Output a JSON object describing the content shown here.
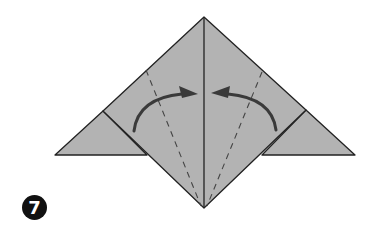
{
  "diagram": {
    "type": "origami-step",
    "step_number": "7",
    "colors": {
      "paper": "#b3b3b3",
      "outline": "#222222",
      "arrow": "#3a3a3a",
      "valley_fold": "#444444",
      "badge": "#111111"
    },
    "elements": [
      {
        "name": "paper-shape",
        "description": "diamond with left and right triangular flaps"
      },
      {
        "name": "center-crease",
        "description": "vertical line from apex to bottom point"
      },
      {
        "name": "valley-fold-left",
        "style": "dashed"
      },
      {
        "name": "valley-fold-right",
        "style": "dashed"
      },
      {
        "name": "fold-arrow-left",
        "direction": "toward center"
      },
      {
        "name": "fold-arrow-right",
        "direction": "toward center"
      }
    ]
  }
}
